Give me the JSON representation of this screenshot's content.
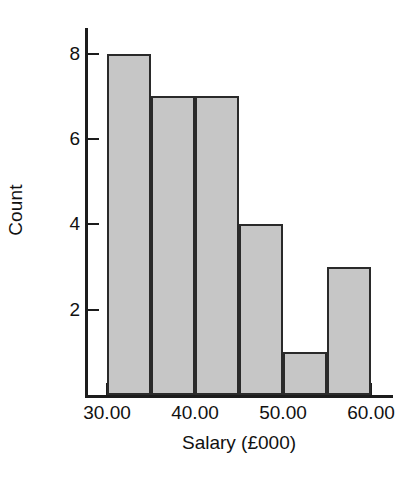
{
  "chart_data": {
    "type": "bar",
    "title": "",
    "subtitle": "",
    "xlabel": "Salary (£000)",
    "ylabel": "Count",
    "grid": false,
    "legend": false,
    "bin_width": 5,
    "categories": [
      "30-35",
      "35-40",
      "40-45",
      "45-50",
      "50-55",
      "55-60"
    ],
    "bin_edges": [
      30,
      35,
      40,
      45,
      50,
      55,
      60
    ],
    "values": [
      8,
      7,
      7,
      4,
      1,
      3
    ],
    "xlim": [
      27.5,
      62.5
    ],
    "ylim": [
      0,
      8.6
    ],
    "x_ticks": [
      30,
      40,
      50,
      60
    ],
    "x_tick_labels": [
      "30.00",
      "40.00",
      "50.00",
      "60.00"
    ],
    "y_ticks": [
      2,
      4,
      6,
      8
    ],
    "y_tick_labels": [
      "2",
      "4",
      "6",
      "8"
    ],
    "bar_fill_color": "#c6c6c6",
    "bar_edge_color": "#2a2a2a",
    "axis_color": "#1c1c1c",
    "background_color": "#ffffff"
  },
  "axes": {
    "y_title": "Count",
    "x_title": "Salary (£000)"
  },
  "y_tick_labels": {
    "t0": "8",
    "t1": "6",
    "t2": "4",
    "t3": "2"
  },
  "x_tick_labels": {
    "t0": "30.00",
    "t1": "40.00",
    "t2": "50.00",
    "t3": "60.00"
  }
}
